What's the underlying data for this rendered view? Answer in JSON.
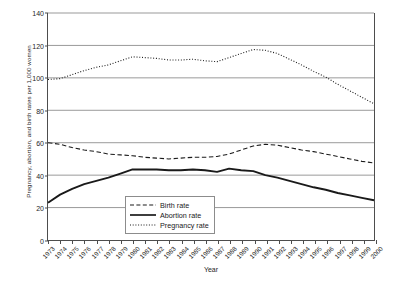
{
  "chart_data": {
    "type": "line",
    "title": "",
    "xlabel": "Year",
    "ylabel": "Pregnancy, abortion, and birth rates per 1,000 women",
    "ylim": [
      0,
      140
    ],
    "yticks": [
      0,
      20,
      40,
      60,
      80,
      100,
      120,
      140
    ],
    "grid": true,
    "legend_position": "inside-bottom-center",
    "categories": [
      "1973",
      "1974",
      "1975",
      "1976",
      "1977",
      "1978",
      "1979",
      "1980",
      "1981",
      "1982",
      "1983",
      "1984",
      "1985",
      "1986",
      "1987",
      "1988",
      "1989",
      "1990",
      "1991",
      "1992",
      "1993",
      "1994",
      "1995",
      "1996",
      "1997",
      "1998",
      "1999",
      "2000"
    ],
    "series": [
      {
        "name": "Birth rate",
        "style": "dashed",
        "values": [
          60.0,
          59.0,
          57.0,
          55.5,
          54.5,
          53.0,
          52.5,
          52.0,
          51.0,
          50.5,
          50.0,
          50.5,
          51.0,
          51.0,
          51.5,
          53.0,
          55.5,
          58.0,
          59.0,
          58.5,
          57.0,
          55.5,
          54.5,
          53.0,
          51.5,
          50.0,
          48.5,
          47.5
        ]
      },
      {
        "name": "Abortion rate",
        "style": "solid",
        "values": [
          23.0,
          28.0,
          31.5,
          34.5,
          36.5,
          38.5,
          41.0,
          43.5,
          43.5,
          43.5,
          43.0,
          43.0,
          43.5,
          43.0,
          42.0,
          44.0,
          43.0,
          42.5,
          40.0,
          38.5,
          36.5,
          34.5,
          32.5,
          31.0,
          29.0,
          27.5,
          26.0,
          24.5
        ]
      },
      {
        "name": "Pregnancy rate",
        "style": "dotted",
        "values": [
          99.0,
          99.5,
          102.0,
          104.5,
          106.5,
          108.0,
          110.5,
          113.0,
          112.5,
          112.0,
          111.0,
          111.0,
          111.5,
          110.5,
          110.0,
          112.5,
          115.0,
          117.5,
          117.0,
          115.0,
          111.5,
          108.0,
          104.0,
          100.5,
          96.0,
          92.0,
          88.0,
          84.0
        ]
      }
    ]
  },
  "legend": {
    "items": [
      {
        "label": "Birth rate"
      },
      {
        "label": "Abortion rate"
      },
      {
        "label": "Pregnancy rate"
      }
    ]
  },
  "colors": {
    "line": "#1a1a1a",
    "grid": "#808080",
    "axis": "#4d4d4d"
  }
}
